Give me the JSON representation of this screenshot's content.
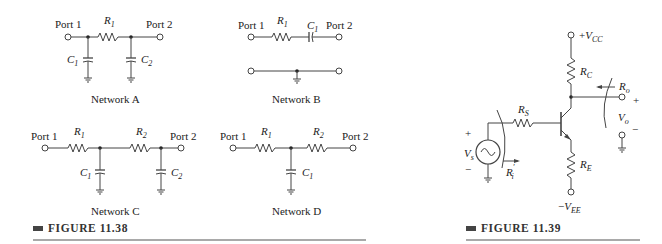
{
  "figure_38": {
    "caption": "FIGURE 11.38",
    "network_a": {
      "title": "Network A",
      "port1": "Port 1",
      "port2": "Port 2",
      "r1": {
        "sym": "R",
        "sub": "1"
      },
      "c1": {
        "sym": "C",
        "sub": "1"
      },
      "c2": {
        "sym": "C",
        "sub": "2"
      }
    },
    "network_b": {
      "title": "Network B",
      "port1": "Port 1",
      "port2": "Port 2",
      "r1": {
        "sym": "R",
        "sub": "1"
      },
      "c1": {
        "sym": "C",
        "sub": "1"
      }
    },
    "network_c": {
      "title": "Network C",
      "port1": "Port 1",
      "port2": "Port 2",
      "r1": {
        "sym": "R",
        "sub": "1"
      },
      "r2": {
        "sym": "R",
        "sub": "2"
      },
      "c1": {
        "sym": "C",
        "sub": "1"
      },
      "c2": {
        "sym": "C",
        "sub": "2"
      }
    },
    "network_d": {
      "title": "Network D",
      "port1": "Port 1",
      "port2": "Port 2",
      "r1": {
        "sym": "R",
        "sub": "1"
      },
      "r2": {
        "sym": "R",
        "sub": "2"
      },
      "c1": {
        "sym": "C",
        "sub": "1"
      }
    }
  },
  "figure_39": {
    "caption": "FIGURE 11.39",
    "vcc": {
      "prefix": "+",
      "sym": "V",
      "sub": "CC"
    },
    "vee": {
      "prefix": "−",
      "sym": "V",
      "sub": "EE"
    },
    "rc": {
      "sym": "R",
      "sub": "C"
    },
    "re": {
      "sym": "R",
      "sub": "E"
    },
    "rs": {
      "sym": "R",
      "sub": "S"
    },
    "ro": {
      "sym": "R",
      "sub": "o"
    },
    "ri": {
      "sym": "R",
      "sub": "i",
      "prime": "′"
    },
    "vs": {
      "sym": "V",
      "sub": "s"
    },
    "vo": {
      "sym": "V",
      "sub": "o"
    },
    "plus": "+",
    "minus": "−"
  }
}
